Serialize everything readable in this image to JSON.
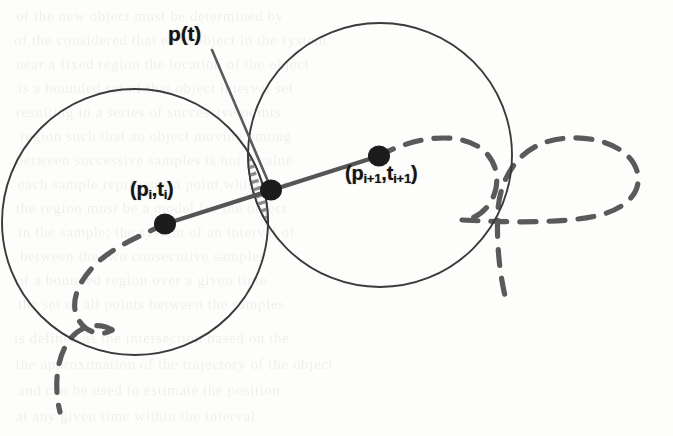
{
  "figure": {
    "kind": "geometric-diagram",
    "caption_labels": {
      "trajectory_point": "p(t)",
      "sample_i_prefix": "(p",
      "sample_i": "(pi,ti)",
      "sample_i_plus_1": "(pi+1,ti+1)"
    },
    "labels": {
      "pt": {
        "text": "p(t)",
        "x": 168,
        "y": 22
      },
      "pi": {
        "base_open": "(p",
        "sub_1": "i",
        "mid": ",t",
        "sub_2": "i",
        "close": ")",
        "x": 130,
        "y": 178
      },
      "pi1": {
        "base_open": "(p",
        "sub_1": "i+1",
        "mid": ",t",
        "sub_2": "i+1",
        "close": ")",
        "x": 345,
        "y": 162
      }
    },
    "colors": {
      "circle_stroke": "#3a3a3a",
      "chord_stroke": "#555555",
      "dot_fill": "#1b1b1b",
      "hatch_stroke": "#8d8d8d",
      "dashed_curve": "#5a5a5a",
      "leader_stroke": "#5a5a5a",
      "background": "#fdfdfc",
      "label_color": "#151515"
    },
    "geometry": {
      "circle_left": {
        "cx": 135,
        "cy": 222,
        "r": 133
      },
      "circle_right": {
        "cx": 380,
        "cy": 155,
        "r": 132
      },
      "dot_left": {
        "cx": 165,
        "cy": 224,
        "r": 11
      },
      "dot_right": {
        "cx": 379,
        "cy": 156,
        "r": 11
      },
      "dot_intersection": {
        "cx": 271,
        "cy": 190,
        "r": 11
      },
      "chord": {
        "x1": 165,
        "y1": 224,
        "x2": 379,
        "y2": 156
      },
      "leader": {
        "x1": 212,
        "y1": 50,
        "x2": 270,
        "y2": 186
      }
    },
    "bleed_text": [
      {
        "text": "of the new object must be determined by",
        "x": 16,
        "y": 8
      },
      {
        "text": "of the considered that each object in the system",
        "x": 14,
        "y": 32
      },
      {
        "text": "near a fixed region the location of the object",
        "x": 16,
        "y": 56
      },
      {
        "text": "is a bounded set of that object interval set",
        "x": 18,
        "y": 80
      },
      {
        "text": "resulting in a series of successive points",
        "x": 16,
        "y": 104
      },
      {
        "text": "region such that an object moving among",
        "x": 20,
        "y": 128
      },
      {
        "text": "between successive samples is not a value",
        "x": 16,
        "y": 152
      },
      {
        "text": "each sample represents a point which can",
        "x": 18,
        "y": 176
      },
      {
        "text": "the region must be a model for the object",
        "x": 16,
        "y": 200
      },
      {
        "text": "in the sample; the system of an interval of",
        "x": 18,
        "y": 224
      },
      {
        "text": "between the two consecutive samples",
        "x": 20,
        "y": 248
      },
      {
        "text": "of a bounded region over a given time",
        "x": 16,
        "y": 272
      },
      {
        "text": "the set of all points between the samples",
        "x": 18,
        "y": 296
      },
      {
        "text": "is defined as the intersection based on the",
        "x": 14,
        "y": 330
      },
      {
        "text": "the approximation of the trajectory of the object",
        "x": 16,
        "y": 356
      },
      {
        "text": "and can be used to estimate the position",
        "x": 18,
        "y": 382
      },
      {
        "text": "at any given time within the interval",
        "x": 16,
        "y": 408
      }
    ]
  }
}
